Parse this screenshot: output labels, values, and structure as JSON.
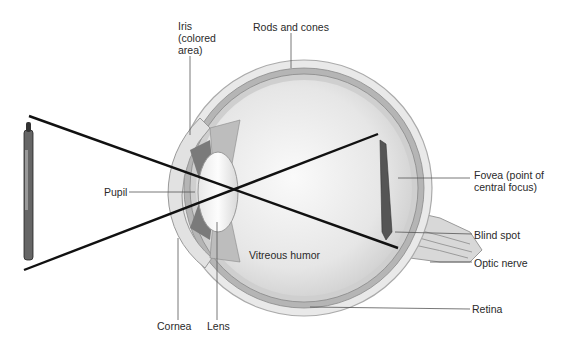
{
  "diagram": {
    "labels": {
      "iris": "Iris\n(colored\narea)",
      "rods_and_cones": "Rods and cones",
      "fovea": "Fovea (point of\ncentral focus)",
      "pupil": "Pupil",
      "blind_spot": "Blind spot",
      "optic_nerve": "Optic nerve",
      "vitreous_humor": "Vitreous humor",
      "retina": "Retina",
      "cornea": "Cornea",
      "lens": "Lens"
    },
    "colors": {
      "line": "#111111",
      "leader": "#555555",
      "sclera": "#e4e4e4",
      "choroid": "#9a9a9a",
      "interior": "#efefef"
    }
  }
}
